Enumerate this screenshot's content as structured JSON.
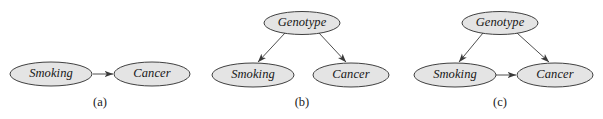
{
  "figure": {
    "background_color": "#ffffff",
    "node_fill_color": "#e4e4e4",
    "node_stroke_color": "#2b2b2b",
    "edge_color": "#3a3a3a",
    "text_color": "#161616"
  },
  "panels": [
    {
      "id": "a",
      "caption": "(a)",
      "caption_x": 100,
      "caption_y": 103,
      "nodes": [
        {
          "id": "smoking",
          "label": "Smoking",
          "cx": 51,
          "cy": 74,
          "rx": 41,
          "ry": 12
        },
        {
          "id": "cancer",
          "label": "Cancer",
          "cx": 152,
          "cy": 74,
          "rx": 38,
          "ry": 12
        }
      ],
      "edges": [
        {
          "from": "smoking",
          "to": "cancer",
          "x1": 93,
          "y1": 74,
          "x2": 113,
          "y2": 74
        }
      ]
    },
    {
      "id": "b",
      "caption": "(b)",
      "caption_x": 302,
      "caption_y": 103,
      "nodes": [
        {
          "id": "genotype",
          "label": "Genotype",
          "cx": 302,
          "cy": 23,
          "rx": 38,
          "ry": 11.5
        },
        {
          "id": "smoking",
          "label": "Smoking",
          "cx": 253,
          "cy": 75,
          "rx": 41,
          "ry": 12
        },
        {
          "id": "cancer",
          "label": "Cancer",
          "cx": 351,
          "cy": 75,
          "rx": 38,
          "ry": 12
        }
      ],
      "edges": [
        {
          "from": "genotype",
          "to": "smoking",
          "x1": 285,
          "y1": 33,
          "x2": 258,
          "y2": 62
        },
        {
          "from": "genotype",
          "to": "cancer",
          "x1": 319,
          "y1": 33,
          "x2": 346,
          "y2": 62
        }
      ]
    },
    {
      "id": "c",
      "caption": "(c)",
      "caption_x": 500,
      "caption_y": 103,
      "nodes": [
        {
          "id": "genotype",
          "label": "Genotype",
          "cx": 500,
          "cy": 23,
          "rx": 38,
          "ry": 11.5
        },
        {
          "id": "smoking",
          "label": "Smoking",
          "cx": 455,
          "cy": 75,
          "rx": 41,
          "ry": 12
        },
        {
          "id": "cancer",
          "label": "Cancer",
          "cx": 555,
          "cy": 75,
          "rx": 38,
          "ry": 12
        }
      ],
      "edges": [
        {
          "from": "genotype",
          "to": "smoking",
          "x1": 483,
          "y1": 33,
          "x2": 459,
          "y2": 62
        },
        {
          "from": "genotype",
          "to": "cancer",
          "x1": 517,
          "y1": 33,
          "x2": 549,
          "y2": 62
        },
        {
          "from": "smoking",
          "to": "cancer",
          "x1": 496,
          "y1": 75,
          "x2": 516,
          "y2": 75
        }
      ]
    }
  ]
}
